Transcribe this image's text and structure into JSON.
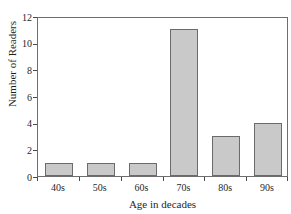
{
  "chart_data": {
    "type": "bar",
    "title": "",
    "title_remnant": "",
    "xlabel": "Age in decades",
    "ylabel": "Number of Readers",
    "categories": [
      "40s",
      "50s",
      "60s",
      "70s",
      "80s",
      "90s"
    ],
    "values": [
      1,
      1,
      1,
      11,
      3,
      4
    ],
    "ylim": [
      0,
      12
    ],
    "yticks": [
      0,
      2,
      4,
      6,
      8,
      10,
      12
    ],
    "ytick_labels": [
      "0",
      "2",
      "4",
      "6",
      "8",
      "10",
      "12"
    ],
    "grid": false,
    "legend": false,
    "legend_position": "none",
    "bar_fill_color": "#c9c9c9",
    "bar_edge_color": "#6b6b6b",
    "axis_color": "#6e6e6e",
    "text_color": "#1f1f1f",
    "background_color": "#ffffff"
  }
}
